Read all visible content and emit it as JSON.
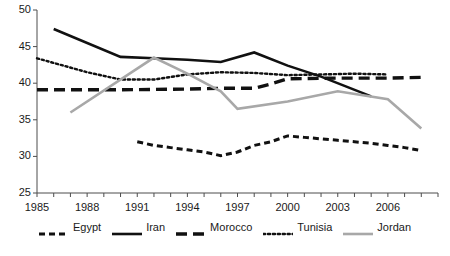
{
  "chart_data": {
    "type": "line",
    "title": "",
    "xlabel": "",
    "ylabel": "",
    "xlim": [
      1985,
      2009
    ],
    "ylim": [
      25,
      50
    ],
    "grid": false,
    "legend_position": "bottom",
    "xticks": [
      1985,
      1986,
      1987,
      1988,
      1989,
      1990,
      1991,
      1992,
      1993,
      1994,
      1995,
      1996,
      1997,
      1998,
      1999,
      2000,
      2001,
      2002,
      2003,
      2004,
      2005,
      2006,
      2007,
      2008,
      2009
    ],
    "xtick_labels": [
      "1985",
      "1988",
      "1991",
      "1994",
      "1997",
      "2000",
      "2003",
      "2006"
    ],
    "xtick_labeled_years": [
      1985,
      1988,
      1991,
      1994,
      1997,
      2000,
      2003,
      2006
    ],
    "yticks": [
      25,
      30,
      35,
      40,
      45,
      50
    ],
    "ytick_labels": [
      "25",
      "30",
      "35",
      "40",
      "45",
      "50"
    ],
    "series": [
      {
        "name": "Egypt",
        "style": "short-dash",
        "color": "#111111",
        "x": [
          1991,
          1992,
          1993,
          1994,
          1995,
          1996,
          1997,
          1998,
          1999,
          2000,
          2001,
          2002,
          2003,
          2004,
          2005,
          2006,
          2007,
          2008
        ],
        "values": [
          32.0,
          31.5,
          31.2,
          30.9,
          30.6,
          30.1,
          30.6,
          31.5,
          32.0,
          32.8,
          32.6,
          32.4,
          32.2,
          32.0,
          31.8,
          31.5,
          31.2,
          30.8
        ]
      },
      {
        "name": "Iran",
        "style": "solid",
        "color": "#111111",
        "x": [
          1986,
          1990,
          1992,
          1994,
          1996,
          1998,
          2000,
          2002,
          2005
        ],
        "values": [
          47.4,
          43.6,
          43.4,
          43.2,
          42.9,
          44.2,
          42.4,
          40.9,
          38.2
        ]
      },
      {
        "name": "Morocco",
        "style": "long-dash",
        "color": "#111111",
        "x": [
          1985,
          1990,
          1994,
          1996,
          1998,
          1999,
          2000,
          2003,
          2006,
          2008
        ],
        "values": [
          39.1,
          39.1,
          39.2,
          39.3,
          39.3,
          39.9,
          40.6,
          40.7,
          40.7,
          40.8
        ]
      },
      {
        "name": "Tunisia",
        "style": "dotted",
        "color": "#111111",
        "x": [
          1985,
          1988,
          1990,
          1992,
          1994,
          1996,
          1998,
          2000,
          2002,
          2004,
          2006
        ],
        "values": [
          43.4,
          41.5,
          40.5,
          40.5,
          41.2,
          41.5,
          41.4,
          41.1,
          41.2,
          41.3,
          41.2
        ]
      },
      {
        "name": "Jordan",
        "style": "solid",
        "color": "#a8a8a8",
        "x": [
          1987,
          1992,
          1994,
          1996,
          1997,
          2000,
          2003,
          2006,
          2008
        ],
        "values": [
          36.0,
          43.5,
          41.3,
          38.9,
          36.5,
          37.5,
          38.9,
          37.8,
          33.8
        ]
      }
    ]
  },
  "legend": {
    "items": [
      {
        "label": "Egypt"
      },
      {
        "label": "Iran"
      },
      {
        "label": "Morocco"
      },
      {
        "label": "Tunisia"
      },
      {
        "label": "Jordan"
      }
    ]
  }
}
